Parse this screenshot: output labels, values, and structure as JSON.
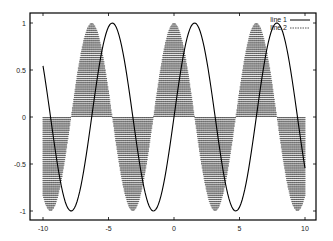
{
  "chart_data": {
    "type": "line",
    "title": "",
    "xlabel": "",
    "ylabel": "",
    "xlim": [
      -10,
      10
    ],
    "ylim": [
      -1,
      1
    ],
    "grid": false,
    "legend_position": "top-right",
    "x_ticks": [
      -10,
      -5,
      0,
      5,
      10
    ],
    "x_tick_labels": [
      "-10",
      "-5",
      "0",
      "5",
      "10"
    ],
    "y_ticks": [
      -1,
      -0.5,
      0,
      0.5,
      1
    ],
    "y_tick_labels": [
      "-1",
      "-0.5",
      "0",
      "0.5",
      "1"
    ],
    "x": [
      -10.0,
      -9.9,
      -9.8,
      -9.7,
      -9.6,
      -9.5,
      -9.4,
      -9.3,
      -9.2,
      -9.1,
      -9.0,
      -8.9,
      -8.8,
      -8.7,
      -8.6,
      -8.5,
      -8.4,
      -8.3,
      -8.2,
      -8.1,
      -8.0,
      -7.9,
      -7.8,
      -7.7,
      -7.6,
      -7.5,
      -7.4,
      -7.3,
      -7.2,
      -7.1,
      -7.0,
      -6.9,
      -6.8,
      -6.7,
      -6.6,
      -6.5,
      -6.4,
      -6.3,
      -6.2,
      -6.1,
      -6.0,
      -5.9,
      -5.8,
      -5.7,
      -5.6,
      -5.5,
      -5.4,
      -5.3,
      -5.2,
      -5.1,
      -5.0,
      -4.9,
      -4.8,
      -4.7,
      -4.6,
      -4.5,
      -4.4,
      -4.3,
      -4.2,
      -4.1,
      -4.0,
      -3.9,
      -3.8,
      -3.7,
      -3.6,
      -3.5,
      -3.4,
      -3.3,
      -3.2,
      -3.1,
      -3.0,
      -2.9,
      -2.8,
      -2.7,
      -2.6,
      -2.5,
      -2.4,
      -2.3,
      -2.2,
      -2.1,
      -2.0,
      -1.9,
      -1.8,
      -1.7,
      -1.6,
      -1.5,
      -1.4,
      -1.3,
      -1.2,
      -1.1,
      -1.0,
      -0.9,
      -0.8,
      -0.7,
      -0.6,
      -0.5,
      -0.4,
      -0.3,
      -0.2,
      -0.1,
      0.0,
      0.1,
      0.2,
      0.3,
      0.4,
      0.5,
      0.6,
      0.7,
      0.8,
      0.9,
      1.0,
      1.1,
      1.2,
      1.3,
      1.4,
      1.5,
      1.6,
      1.7,
      1.8,
      1.9,
      2.0,
      2.1,
      2.2,
      2.3,
      2.4,
      2.5,
      2.6,
      2.7,
      2.8,
      2.9,
      3.0,
      3.1,
      3.2,
      3.3,
      3.4,
      3.5,
      3.6,
      3.7,
      3.8,
      3.9,
      4.0,
      4.1,
      4.2,
      4.3,
      4.4,
      4.5,
      4.6,
      4.7,
      4.8,
      4.9,
      5.0,
      5.1,
      5.2,
      5.3,
      5.4,
      5.5,
      5.6,
      5.7,
      5.8,
      5.9,
      6.0,
      6.1,
      6.2,
      6.3,
      6.4,
      6.5,
      6.6,
      6.7,
      6.8,
      6.9,
      7.0,
      7.1,
      7.2,
      7.3,
      7.4,
      7.5,
      7.6,
      7.7,
      7.8,
      7.9,
      8.0,
      8.1,
      8.2,
      8.3,
      8.4,
      8.5,
      8.6,
      8.7,
      8.8,
      8.9,
      9.0,
      9.1,
      9.2,
      9.3,
      9.4,
      9.5,
      9.6,
      9.7,
      9.8,
      9.9,
      10.0
    ],
    "series": [
      {
        "name": "line 1",
        "style": "lines",
        "dash": "solid",
        "color": "#000000",
        "function": "sin(x)",
        "values": [
          0.544,
          0.458,
          0.366,
          0.271,
          0.173,
          0.075,
          -0.025,
          -0.124,
          -0.223,
          -0.319,
          -0.412,
          -0.501,
          -0.585,
          -0.663,
          -0.734,
          -0.798,
          -0.855,
          -0.904,
          -0.941,
          -0.97,
          -0.989,
          -0.999,
          -0.999,
          -0.988,
          -0.968,
          -0.938,
          -0.899,
          -0.85,
          -0.794,
          -0.729,
          -0.657,
          -0.578,
          -0.494,
          -0.405,
          -0.312,
          -0.215,
          -0.117,
          -0.017,
          0.083,
          0.182,
          0.279,
          0.374,
          0.465,
          0.551,
          0.632,
          0.706,
          0.773,
          0.832,
          0.883,
          0.926,
          0.959,
          0.982,
          0.996,
          1.0,
          0.994,
          0.978,
          0.952,
          0.916,
          0.872,
          0.818,
          0.757,
          0.688,
          0.612,
          0.53,
          0.443,
          0.351,
          0.256,
          0.158,
          0.058,
          -0.042,
          -0.141,
          -0.239,
          -0.335,
          -0.427,
          -0.516,
          -0.598,
          -0.675,
          -0.746,
          -0.808,
          -0.863,
          -0.909,
          -0.946,
          -0.974,
          -0.992,
          -1.0,
          -0.997,
          -0.985,
          -0.964,
          -0.932,
          -0.891,
          -0.841,
          -0.783,
          -0.717,
          -0.644,
          -0.565,
          -0.479,
          -0.389,
          -0.296,
          -0.199,
          -0.1,
          0.0,
          0.1,
          0.199,
          0.296,
          0.389,
          0.479,
          0.565,
          0.644,
          0.717,
          0.783,
          0.841,
          0.891,
          0.932,
          0.964,
          0.985,
          0.997,
          1.0,
          0.992,
          0.974,
          0.946,
          0.909,
          0.863,
          0.808,
          0.746,
          0.675,
          0.598,
          0.516,
          0.427,
          0.335,
          0.239,
          0.141,
          0.042,
          -0.058,
          -0.158,
          -0.256,
          -0.351,
          -0.443,
          -0.53,
          -0.612,
          -0.688,
          -0.757,
          -0.818,
          -0.872,
          -0.916,
          -0.952,
          -0.978,
          -0.994,
          -1.0,
          -0.996,
          -0.982,
          -0.959,
          -0.926,
          -0.883,
          -0.832,
          -0.773,
          -0.706,
          -0.632,
          -0.551,
          -0.465,
          -0.374,
          -0.279,
          -0.182,
          -0.083,
          0.017,
          0.117,
          0.215,
          0.312,
          0.405,
          0.494,
          0.578,
          0.657,
          0.729,
          0.794,
          0.85,
          0.899,
          0.938,
          0.968,
          0.988,
          0.999,
          0.999,
          0.989,
          0.97,
          0.941,
          0.904,
          0.855,
          0.798,
          0.734,
          0.663,
          0.585,
          0.501,
          0.412,
          0.319,
          0.223,
          0.124,
          0.025,
          -0.075,
          -0.173,
          -0.271,
          -0.366,
          -0.458,
          -0.544
        ]
      },
      {
        "name": "line 2",
        "style": "impulses",
        "dash": "dashed",
        "color": "#555555",
        "function": "cos(x)",
        "values": [
          -0.839,
          -0.889,
          -0.931,
          -0.963,
          -0.985,
          -0.997,
          -1.0,
          -0.992,
          -0.975,
          -0.948,
          -0.911,
          -0.865,
          -0.811,
          -0.749,
          -0.679,
          -0.602,
          -0.519,
          -0.431,
          -0.338,
          -0.242,
          -0.146,
          -0.046,
          0.054,
          0.153,
          0.251,
          0.347,
          0.439,
          0.527,
          0.608,
          0.685,
          0.754,
          0.815,
          0.869,
          0.914,
          0.95,
          0.977,
          0.993,
          1.0,
          0.997,
          0.984,
          0.96,
          0.927,
          0.886,
          0.835,
          0.776,
          0.709,
          0.635,
          0.554,
          0.469,
          0.378,
          0.284,
          0.187,
          0.087,
          -0.012,
          -0.112,
          -0.211,
          -0.307,
          -0.401,
          -0.49,
          -0.575,
          -0.654,
          -0.726,
          -0.791,
          -0.848,
          -0.897,
          -0.936,
          -0.967,
          -0.987,
          -0.998,
          -0.999,
          -0.99,
          -0.971,
          -0.942,
          -0.904,
          -0.857,
          -0.801,
          -0.737,
          -0.666,
          -0.589,
          -0.505,
          -0.416,
          -0.323,
          -0.227,
          -0.129,
          -0.029,
          0.071,
          0.17,
          0.267,
          0.362,
          0.454,
          0.54,
          0.622,
          0.697,
          0.765,
          0.825,
          0.878,
          0.921,
          0.955,
          0.98,
          0.995,
          1.0,
          0.995,
          0.98,
          0.955,
          0.921,
          0.878,
          0.825,
          0.765,
          0.697,
          0.622,
          0.54,
          0.454,
          0.362,
          0.267,
          0.17,
          0.071,
          -0.029,
          -0.129,
          -0.227,
          -0.323,
          -0.416,
          -0.505,
          -0.589,
          -0.666,
          -0.737,
          -0.801,
          -0.857,
          -0.904,
          -0.942,
          -0.971,
          -0.99,
          -0.999,
          -0.998,
          -0.987,
          -0.967,
          -0.936,
          -0.897,
          -0.848,
          -0.791,
          -0.726,
          -0.654,
          -0.575,
          -0.49,
          -0.401,
          -0.307,
          -0.211,
          -0.112,
          -0.012,
          0.087,
          0.187,
          0.284,
          0.378,
          0.469,
          0.554,
          0.635,
          0.709,
          0.776,
          0.835,
          0.886,
          0.927,
          0.96,
          0.984,
          0.997,
          1.0,
          0.993,
          0.977,
          0.95,
          0.914,
          0.869,
          0.815,
          0.754,
          0.685,
          0.608,
          0.527,
          0.439,
          0.347,
          0.251,
          0.153,
          0.054,
          -0.046,
          -0.146,
          -0.242,
          -0.338,
          -0.431,
          -0.519,
          -0.602,
          -0.679,
          -0.749,
          -0.811,
          -0.865,
          -0.911,
          -0.948,
          -0.975,
          -0.992,
          -1.0,
          -0.997,
          -0.985,
          -0.963,
          -0.931,
          -0.889,
          -0.839
        ]
      }
    ]
  },
  "plot_area": {
    "left": 30,
    "top": 13,
    "right": 316,
    "bottom": 220,
    "x_min_px": 43,
    "x_max_px": 305,
    "y_max_px": 23,
    "y_min_px": 211
  },
  "legend": {
    "items": [
      {
        "label": "line 1",
        "dash": "solid"
      },
      {
        "label": "line 2",
        "dash": "dashed"
      }
    ]
  }
}
